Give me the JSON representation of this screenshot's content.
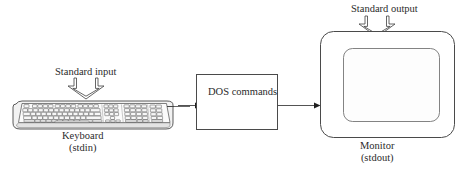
{
  "diagram": {
    "title_present": false,
    "background_color": "#ffffff",
    "line_color": "#3a3a3a",
    "text_color": "#2b2b2b",
    "labels": {
      "standard_input": "Standard input",
      "standard_output": "Standard output",
      "keyboard_name": "Keyboard",
      "keyboard_stream": "(stdin)",
      "monitor_name": "Monitor",
      "monitor_stream": "(stdout)",
      "process_line1": "DOS",
      "process_line2": "commands"
    },
    "nodes": [
      {
        "id": "keyboard",
        "kind": "keyboard-illustration",
        "label": "Keyboard",
        "sublabel": "(stdin)"
      },
      {
        "id": "dos-commands",
        "kind": "process-box",
        "label": "DOS commands"
      },
      {
        "id": "monitor",
        "kind": "monitor-illustration",
        "label": "Monitor",
        "sublabel": "(stdout)"
      }
    ],
    "edges": [
      {
        "id": "keyboard-to-dos",
        "from": "keyboard",
        "to": "dos-commands",
        "style": "solid-line-with-arrowhead"
      },
      {
        "id": "dos-to-monitor",
        "from": "dos-commands",
        "to": "monitor",
        "style": "solid-line-with-arrowhead"
      }
    ],
    "annotations": [
      {
        "id": "standard-input-annotation",
        "text": "Standard input",
        "arrow": "hollow-fork-arrow-down",
        "points_to": "keyboard"
      },
      {
        "id": "standard-output-annotation",
        "text": "Standard output",
        "arrow": "hollow-fork-arrow-down",
        "points_to": "monitor"
      }
    ]
  }
}
